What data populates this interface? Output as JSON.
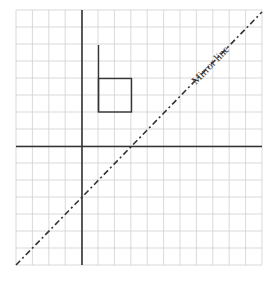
{
  "diagram": {
    "type": "reflection-grid",
    "grid": {
      "columns": 15,
      "rows": 15,
      "color": "#cfcfcf"
    },
    "axes": {
      "vertical_at_column": 4,
      "horizontal_at_row": 8,
      "color": "#333333"
    },
    "mirror_line": {
      "label": "Mirror line",
      "equation": "y = x",
      "style": "dash-dot",
      "color": "#333333"
    },
    "shape": {
      "description": "Flag shape: vertical stem with square attached at bottom-right",
      "stem": {
        "from": [
          1,
          6
        ],
        "to": [
          1,
          2
        ]
      },
      "square": [
        [
          1,
          2
        ],
        [
          3,
          2
        ],
        [
          3,
          0
        ],
        [
          1,
          0
        ]
      ],
      "color": "#333333"
    }
  }
}
